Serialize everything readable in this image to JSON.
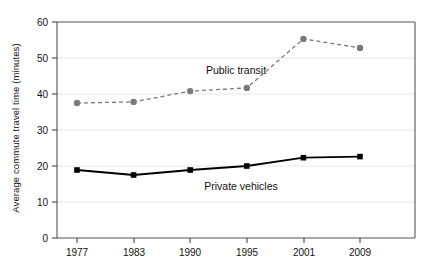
{
  "chart_data": {
    "type": "line",
    "title": "",
    "xlabel": "",
    "ylabel": "Average commute travel time (minutes)",
    "categories": [
      "1977",
      "1983",
      "1990",
      "1995",
      "2001",
      "2009"
    ],
    "ylim": [
      0,
      60
    ],
    "yticks": [
      "0",
      "10",
      "20",
      "30",
      "40",
      "50",
      "60"
    ],
    "ytick_values": [
      0,
      10,
      20,
      30,
      40,
      50,
      60
    ],
    "grid": "horizontal",
    "legend_position": "inline-annotation",
    "series": [
      {
        "name": "Public transit",
        "values": [
          37.5,
          37.8,
          40.8,
          41.7,
          55.3,
          52.8
        ],
        "color": "#7a7a7a",
        "line_style": "dashed",
        "marker": "circle"
      },
      {
        "name": "Private vehicles",
        "values": [
          18.9,
          17.5,
          18.9,
          20.0,
          22.3,
          22.6
        ],
        "color": "#000000",
        "line_style": "solid",
        "marker": "square"
      }
    ],
    "annotations": [
      {
        "text": "Public transit",
        "x": 236,
        "y": 74
      },
      {
        "text": "Private vehicles",
        "x": 241,
        "y": 190
      }
    ]
  },
  "axes": {
    "y_axis_label": "Average commute travel time (minutes)",
    "y_tick_labels": [
      "60",
      "50",
      "40",
      "30",
      "20",
      "10",
      "0"
    ],
    "x_tick_labels": [
      "1977",
      "1983",
      "1990",
      "1995",
      "2001",
      "2009"
    ]
  }
}
